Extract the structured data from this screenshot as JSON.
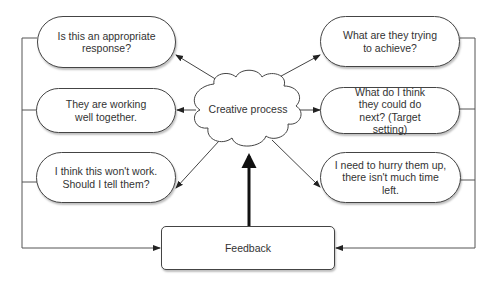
{
  "diagram": {
    "center": {
      "label": "Creative process",
      "shape": "cloud"
    },
    "left_nodes": [
      {
        "label": "Is this an appropriate response?"
      },
      {
        "label": "They are working well together."
      },
      {
        "label": "I think this won't work. Should I tell them?"
      }
    ],
    "right_nodes": [
      {
        "label": "What are they trying to achieve?"
      },
      {
        "label": "What do I think they could do next? (Target setting)"
      },
      {
        "label": "I need to hurry them up, there isn't much time left."
      }
    ],
    "feedback": {
      "label": "Feedback"
    },
    "colors": {
      "stroke": "#444444",
      "text": "#333333",
      "background": "#ffffff"
    },
    "edges": [
      "Creative process -> Is this an appropriate response?",
      "Creative process -> They are working well together.",
      "Creative process -> I think this won't work. Should I tell them?",
      "Creative process -> What are they trying to achieve?",
      "Creative process -> What do I think they could do next? (Target setting)",
      "Creative process -> I need to hurry them up, there isn't much time left.",
      "Left nodes -> Feedback",
      "Right nodes -> Feedback",
      "Feedback -> Creative process (bold)"
    ]
  }
}
